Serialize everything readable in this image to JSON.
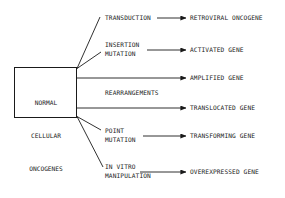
{
  "diagram": {
    "type": "flow-diagram",
    "background_color": "#ffffff",
    "line_color": "#1a1a1a",
    "text_color": "#1a1a1a",
    "source": {
      "label_lines": [
        "NORMAL",
        "CELLULAR",
        "ONCOGENES"
      ],
      "shape": "rectangle"
    },
    "group_label": "REARRANGEMENTS",
    "branches": [
      {
        "mechanism_lines": [
          "TRANSDUCTION"
        ],
        "outcome": "RETROVIRAL ONCOGENE",
        "connector": "diagonal-up",
        "arrow": "filled-triangle"
      },
      {
        "mechanism_lines": [
          "INSERTION",
          "MUTATION"
        ],
        "outcome": "ACTIVATED GENE",
        "connector": "diagonal-up",
        "arrow": "filled-triangle"
      },
      {
        "mechanism_lines": [],
        "outcome": "AMPLIFIED GENE",
        "connector": "horizontal",
        "arrow": "filled-triangle"
      },
      {
        "mechanism_lines": [],
        "outcome": "TRANSLOCATED GENE",
        "connector": "horizontal",
        "arrow": "filled-triangle"
      },
      {
        "mechanism_lines": [
          "POINT",
          "MUTATION"
        ],
        "outcome": "TRANSFORMING GENE",
        "connector": "diagonal-down",
        "arrow": "filled-triangle"
      },
      {
        "mechanism_lines": [
          "IN VITRO",
          "MANIPULATION"
        ],
        "outcome": "OVEREXPRESSED GENE",
        "connector": "diagonal-down",
        "arrow": "filled-triangle"
      }
    ]
  }
}
